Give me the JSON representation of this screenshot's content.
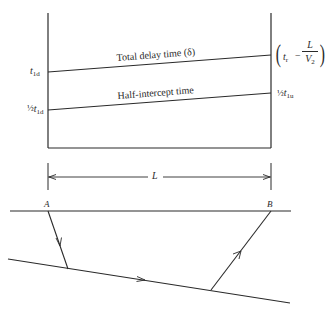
{
  "diagram": {
    "upper_plot": {
      "lines": [
        {
          "label": "Total delay time (δ)",
          "left_label": "t",
          "left_sub": "1d",
          "right_label": "(t_r − L/V_2)"
        },
        {
          "label": "Half-intercept time",
          "left_prefix": "½",
          "left_label": "t",
          "left_sub": "1d",
          "right_prefix": "½",
          "right_label": "t",
          "right_sub": "1u"
        }
      ],
      "total_delay_label": "Total delay time (δ)",
      "half_intercept_label": "Half-intercept time",
      "left_top": {
        "var": "t",
        "sub": "1d"
      },
      "left_bottom": {
        "prefix": "½",
        "var": "t",
        "sub": "1d"
      },
      "right_top": {
        "var": "t",
        "sub": "r",
        "minus": "−",
        "numerator": "L",
        "denominator": "V",
        "denominator_sub": "2"
      },
      "right_bottom": {
        "prefix": "½",
        "var": "t",
        "sub": "1u"
      }
    },
    "dimension": {
      "label": "L"
    },
    "cross_section": {
      "point_a": "A",
      "point_b": "B"
    },
    "colors": {
      "ink": "#2a2a2a",
      "background": "#ffffff"
    }
  }
}
